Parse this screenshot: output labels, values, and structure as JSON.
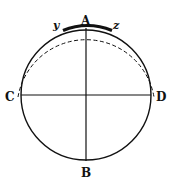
{
  "diagram": {
    "circle": {
      "cx": 86,
      "cy": 95,
      "r": 65,
      "stroke": "#111111"
    },
    "labels": {
      "A": "A",
      "B": "B",
      "C": "C",
      "D": "D",
      "y": "y",
      "z": "z"
    },
    "lines": [
      {
        "name": "vertical-diameter-AB",
        "from": "A",
        "to": "B"
      },
      {
        "name": "horizontal-diameter-CD",
        "from": "C",
        "to": "D"
      }
    ],
    "arcs": [
      {
        "name": "thick-arc-yz",
        "from": "y",
        "to": "z",
        "style": "thick"
      },
      {
        "name": "dashed-arc-CD-upper",
        "from": "C",
        "to": "D",
        "style": "dashed",
        "offset": "outside"
      }
    ]
  }
}
